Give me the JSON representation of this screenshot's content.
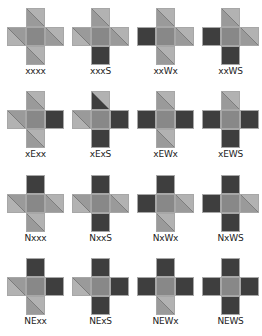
{
  "colors": {
    "light": "#b2b2b2",
    "mid": "#9a9a9a",
    "dark": "#3e3e3e",
    "center": "#888888",
    "diagonal": "#555555"
  },
  "grid": {
    "col_x": [
      7,
      72,
      137,
      202
    ],
    "row_y": [
      8,
      91,
      175,
      258
    ]
  },
  "tiles": [
    {
      "label": "xxxx",
      "n": [
        "M",
        "L"
      ],
      "w": [
        "L",
        "M"
      ],
      "e": [
        "M",
        "L"
      ],
      "s": [
        "M",
        "L"
      ]
    },
    {
      "label": "xxxS",
      "n": [
        "M",
        "L"
      ],
      "w": [
        "L",
        "M"
      ],
      "e": [
        "M",
        "L"
      ],
      "s": "D"
    },
    {
      "label": "xxWx",
      "n": [
        "M",
        "L"
      ],
      "w": "D",
      "e": [
        "M",
        "L"
      ],
      "s": [
        "M",
        "L"
      ]
    },
    {
      "label": "xxWS",
      "n": [
        "M",
        "L"
      ],
      "w": "D",
      "e": [
        "M",
        "L"
      ],
      "s": "D"
    },
    {
      "label": "xExx",
      "n": [
        "M",
        "L"
      ],
      "w": [
        "L",
        "M"
      ],
      "e": "D",
      "s": [
        "M",
        "L"
      ]
    },
    {
      "label": "xExS",
      "n": [
        "D",
        "L"
      ],
      "w": [
        "L",
        "M"
      ],
      "e": "D",
      "s": "D"
    },
    {
      "label": "xEWx",
      "n": [
        "M",
        "L"
      ],
      "w": "D",
      "e": "D",
      "s": [
        "M",
        "L"
      ]
    },
    {
      "label": "xEWS",
      "n": [
        "M",
        "L"
      ],
      "w": "D",
      "e": "D",
      "s": "D"
    },
    {
      "label": "Nxxx",
      "n": "D",
      "w": [
        "L",
        "M"
      ],
      "e": [
        "M",
        "L"
      ],
      "s": [
        "M",
        "L"
      ]
    },
    {
      "label": "NxxS",
      "n": "D",
      "w": [
        "L",
        "M"
      ],
      "e": [
        "M",
        "L"
      ],
      "s": "D"
    },
    {
      "label": "NxWx",
      "n": "D",
      "w": "D",
      "e": [
        "M",
        "L"
      ],
      "s": [
        "M",
        "L"
      ]
    },
    {
      "label": "NxWS",
      "n": "D",
      "w": "D",
      "e": [
        "M",
        "L"
      ],
      "s": "D"
    },
    {
      "label": "NExx",
      "n": "D",
      "w": [
        "L",
        "M"
      ],
      "e": "D",
      "s": [
        "M",
        "L"
      ]
    },
    {
      "label": "NExS",
      "n": "D",
      "w": [
        "L",
        "M"
      ],
      "e": "D",
      "s": "D"
    },
    {
      "label": "NEWx",
      "n": "D",
      "w": "D",
      "e": "D",
      "s": [
        "M",
        "L"
      ]
    },
    {
      "label": "NEWS",
      "n": "D",
      "w": "D",
      "e": "D",
      "s": "D"
    }
  ]
}
